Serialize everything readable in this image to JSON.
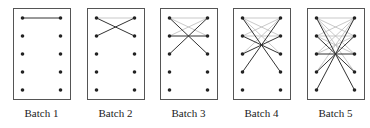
{
  "figure": {
    "rows": 5,
    "colors": {
      "frame": "#555555",
      "dot": "#222222",
      "current_edge": "#333333",
      "previous_edge": "#bbbbbb"
    },
    "panels": [
      {
        "label": "Batch 1",
        "x": 13,
        "current": [
          [
            1,
            1
          ]
        ],
        "previous": []
      },
      {
        "label": "Batch 2",
        "x": 87,
        "current": [
          [
            1,
            2
          ],
          [
            2,
            1
          ]
        ],
        "previous": [
          [
            1,
            1
          ]
        ]
      },
      {
        "label": "Batch 3",
        "x": 160,
        "current": [
          [
            1,
            3
          ],
          [
            3,
            1
          ],
          [
            2,
            2
          ]
        ],
        "previous": [
          [
            1,
            1
          ],
          [
            1,
            2
          ],
          [
            2,
            1
          ]
        ]
      },
      {
        "label": "Batch 4",
        "x": 233,
        "current": [
          [
            1,
            4
          ],
          [
            4,
            1
          ],
          [
            2,
            3
          ],
          [
            3,
            2
          ]
        ],
        "previous": [
          [
            1,
            1
          ],
          [
            1,
            2
          ],
          [
            2,
            1
          ],
          [
            1,
            3
          ],
          [
            3,
            1
          ],
          [
            2,
            2
          ]
        ]
      },
      {
        "label": "Batch 5",
        "x": 307,
        "current": [
          [
            1,
            5
          ],
          [
            5,
            1
          ],
          [
            2,
            4
          ],
          [
            4,
            2
          ],
          [
            3,
            3
          ]
        ],
        "previous": [
          [
            1,
            1
          ],
          [
            1,
            2
          ],
          [
            2,
            1
          ],
          [
            1,
            3
          ],
          [
            3,
            1
          ],
          [
            2,
            2
          ],
          [
            1,
            4
          ],
          [
            4,
            1
          ],
          [
            2,
            3
          ],
          [
            3,
            2
          ]
        ]
      }
    ]
  }
}
